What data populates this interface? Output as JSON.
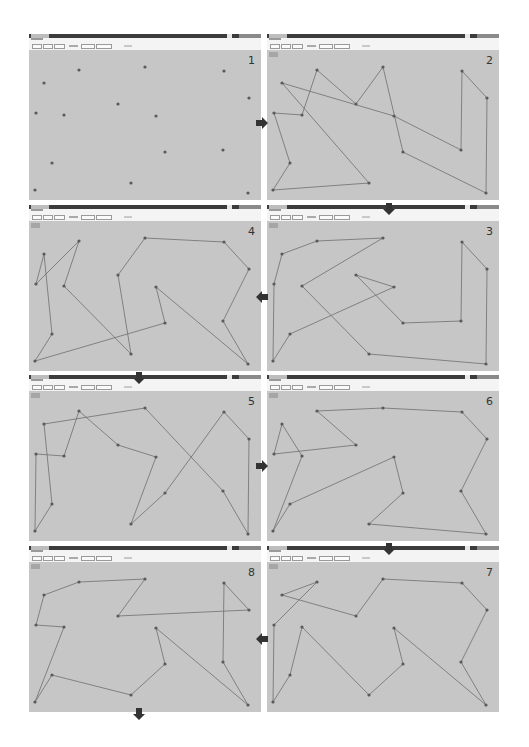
{
  "figure": {
    "colors": {
      "canvas": "#c6c6c6",
      "edge": "#6e6e6e",
      "node": "#5a5a5a",
      "titlebar": "#3c3c3c",
      "arrow": "#333333"
    }
  },
  "cities": [
    {
      "id": "A",
      "x": 50,
      "y": 16
    },
    {
      "id": "B",
      "x": 116,
      "y": 13
    },
    {
      "id": "C",
      "x": 195,
      "y": 17
    },
    {
      "id": "D",
      "x": 15,
      "y": 29
    },
    {
      "id": "E",
      "x": 220,
      "y": 44
    },
    {
      "id": "F",
      "x": 89,
      "y": 50
    },
    {
      "id": "G",
      "x": 7,
      "y": 59
    },
    {
      "id": "H",
      "x": 35,
      "y": 61
    },
    {
      "id": "I",
      "x": 127,
      "y": 62
    },
    {
      "id": "J",
      "x": 136,
      "y": 98
    },
    {
      "id": "K",
      "x": 194,
      "y": 96
    },
    {
      "id": "L",
      "x": 23,
      "y": 109
    },
    {
      "id": "M",
      "x": 102,
      "y": 129
    },
    {
      "id": "N",
      "x": 6,
      "y": 136
    },
    {
      "id": "O",
      "x": 219,
      "y": 139
    }
  ],
  "panels": [
    {
      "number": "1",
      "left": 29,
      "top": 34,
      "tour": []
    },
    {
      "number": "2",
      "left": 267,
      "top": 34,
      "tour": [
        "D",
        "I",
        "K",
        "C",
        "E",
        "O",
        "J",
        "B",
        "F",
        "A",
        "H",
        "G",
        "L",
        "N",
        "M",
        "D"
      ]
    },
    {
      "number": "3",
      "left": 267,
      "top": 205,
      "tour": [
        "A",
        "B",
        "H",
        "M",
        "O",
        "E",
        "C",
        "K",
        "J",
        "F",
        "I",
        "L",
        "N",
        "G",
        "D",
        "A"
      ]
    },
    {
      "number": "4",
      "left": 29,
      "top": 205,
      "tour": [
        "D",
        "G",
        "A",
        "H",
        "M",
        "F",
        "B",
        "C",
        "E",
        "K",
        "O",
        "I",
        "J",
        "N",
        "L",
        "D"
      ]
    },
    {
      "number": "5",
      "left": 29,
      "top": 375,
      "tour": [
        "D",
        "B",
        "K",
        "O",
        "E",
        "C",
        "J",
        "M",
        "I",
        "F",
        "A",
        "H",
        "G",
        "N",
        "L",
        "D"
      ]
    },
    {
      "number": "6",
      "left": 267,
      "top": 375,
      "tour": [
        "A",
        "B",
        "C",
        "E",
        "K",
        "O",
        "M",
        "J",
        "I",
        "L",
        "N",
        "H",
        "D",
        "G",
        "F",
        "A"
      ]
    },
    {
      "number": "7",
      "left": 267,
      "top": 546,
      "tour": [
        "D",
        "A",
        "G",
        "N",
        "L",
        "H",
        "M",
        "J",
        "I",
        "O",
        "K",
        "E",
        "C",
        "B",
        "F",
        "D"
      ]
    },
    {
      "number": "8",
      "left": 29,
      "top": 546,
      "tour": [
        "D",
        "A",
        "B",
        "F",
        "E",
        "C",
        "K",
        "O",
        "I",
        "J",
        "M",
        "L",
        "N",
        "H",
        "G",
        "D"
      ]
    }
  ],
  "arrows": [
    {
      "dir": "right",
      "x": 256,
      "y": 114,
      "from": "1",
      "to": "2"
    },
    {
      "dir": "down",
      "x": 383,
      "y": 200,
      "from": "2",
      "to": "3"
    },
    {
      "dir": "left",
      "x": 256,
      "y": 288,
      "from": "3",
      "to": "4"
    },
    {
      "dir": "down",
      "x": 133,
      "y": 369,
      "from": "4",
      "to": "5"
    },
    {
      "dir": "right",
      "x": 256,
      "y": 457,
      "from": "5",
      "to": "6"
    },
    {
      "dir": "down",
      "x": 383,
      "y": 540,
      "from": "6",
      "to": "7"
    },
    {
      "dir": "left",
      "x": 256,
      "y": 630,
      "from": "7",
      "to": "8"
    },
    {
      "dir": "down",
      "x": 133,
      "y": 705,
      "from": "8",
      "to": "end"
    }
  ]
}
